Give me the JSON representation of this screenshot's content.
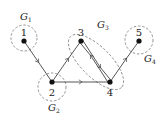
{
  "diagram": {
    "type": "directed-graph",
    "nodes": [
      {
        "id": "1",
        "label": "1",
        "x": 24,
        "y": 41
      },
      {
        "id": "2",
        "label": "2",
        "x": 52,
        "y": 82
      },
      {
        "id": "3",
        "label": "3",
        "x": 81,
        "y": 41
      },
      {
        "id": "4",
        "label": "4",
        "x": 110,
        "y": 82
      },
      {
        "id": "5",
        "label": "5",
        "x": 139,
        "y": 41
      }
    ],
    "edges": [
      {
        "from": "1",
        "to": "2"
      },
      {
        "from": "2",
        "to": "3"
      },
      {
        "from": "2",
        "to": "4"
      },
      {
        "from": "3",
        "to": "4"
      },
      {
        "from": "4",
        "to": "3"
      },
      {
        "from": "4",
        "to": "5"
      }
    ],
    "groups": [
      {
        "id": "G1",
        "label": "G",
        "subscript": "1",
        "members": [
          "1"
        ]
      },
      {
        "id": "G2",
        "label": "G",
        "subscript": "2",
        "members": [
          "2"
        ]
      },
      {
        "id": "G3",
        "label": "G",
        "subscript": "3",
        "members": [
          "3",
          "4"
        ]
      },
      {
        "id": "G4",
        "label": "G",
        "subscript": "4",
        "members": [
          "5"
        ]
      }
    ],
    "colors": {
      "node": "#111111",
      "edge": "#444444",
      "group_outline": "#777777"
    }
  }
}
